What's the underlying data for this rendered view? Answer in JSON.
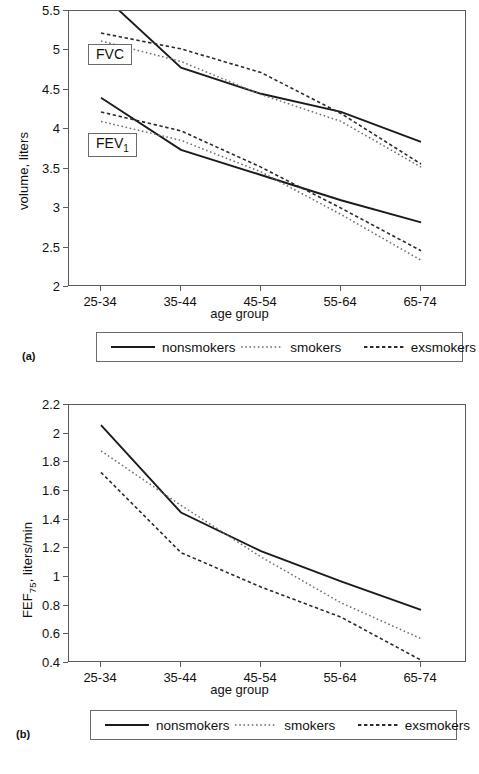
{
  "figure": {
    "panels": [
      {
        "letter": "(a)",
        "xlabel": "age group",
        "ylabel_prefix": "volume, liters",
        "ylabel_sub": "",
        "ylabel_suffix": "",
        "annotations": [
          {
            "name": "fvc",
            "prefix": "FVC",
            "sub": "",
            "suffix": ""
          },
          {
            "name": "fev1",
            "prefix": "FEV",
            "sub": "1",
            "suffix": ""
          }
        ]
      },
      {
        "letter": "(b)",
        "xlabel": "age group",
        "ylabel_prefix": "FEF",
        "ylabel_sub": "75",
        "ylabel_suffix": ", liters/min",
        "annotations": []
      }
    ],
    "legend": {
      "items": [
        {
          "label": "nonsmokers",
          "style": "solid"
        },
        {
          "label": "smokers",
          "style": "dotted"
        },
        {
          "label": "exsmokers",
          "style": "dashed"
        }
      ]
    }
  },
  "chart_data": [
    {
      "id": "panel-a",
      "type": "line",
      "title": "",
      "xlabel": "age group",
      "ylabel": "volume, liters",
      "categories": [
        "25-34",
        "35-44",
        "45-54",
        "55-64",
        "65-74"
      ],
      "ylim": [
        2,
        5.5
      ],
      "yticks": [
        2,
        2.5,
        3,
        3.5,
        4,
        4.5,
        5,
        5.5
      ],
      "ytick_labels": [
        "2",
        "2.5",
        "3",
        "3.5",
        "4",
        "4.5",
        "5",
        "5.5"
      ],
      "grid": false,
      "legend_position": "below",
      "measures": [
        "FVC",
        "FEV1"
      ],
      "series": [
        {
          "name": "nonsmokers",
          "measure": "FVC",
          "style": "solid",
          "values": [
            5.72,
            4.78,
            4.45,
            4.22,
            3.84
          ]
        },
        {
          "name": "smokers",
          "measure": "FVC",
          "style": "dotted",
          "values": [
            5.12,
            4.86,
            4.44,
            4.1,
            3.52
          ]
        },
        {
          "name": "exsmokers",
          "measure": "FVC",
          "style": "dashed",
          "values": [
            5.22,
            5.02,
            4.72,
            4.2,
            3.56
          ]
        },
        {
          "name": "nonsmokers",
          "measure": "FEV1",
          "style": "solid",
          "values": [
            4.4,
            3.74,
            3.42,
            3.1,
            2.82
          ]
        },
        {
          "name": "smokers",
          "measure": "FEV1",
          "style": "dotted",
          "values": [
            4.1,
            3.86,
            3.46,
            2.92,
            2.34
          ]
        },
        {
          "name": "exsmokers",
          "measure": "FEV1",
          "style": "dashed",
          "values": [
            4.22,
            3.98,
            3.52,
            3.0,
            2.46
          ]
        }
      ]
    },
    {
      "id": "panel-b",
      "type": "line",
      "title": "",
      "xlabel": "age group",
      "ylabel": "FEF75, liters/min",
      "categories": [
        "25-34",
        "35-44",
        "45-54",
        "55-64",
        "65-74"
      ],
      "ylim": [
        0.4,
        2.2
      ],
      "yticks": [
        0.4,
        0.6,
        0.8,
        1.0,
        1.2,
        1.4,
        1.6,
        1.8,
        2.0,
        2.2
      ],
      "ytick_labels": [
        "0.4",
        "0.6",
        "0.8",
        "1",
        "1.2",
        "1.4",
        "1.6",
        "1.8",
        "2",
        "2.2"
      ],
      "grid": false,
      "legend_position": "below",
      "series": [
        {
          "name": "nonsmokers",
          "style": "solid",
          "values": [
            2.06,
            1.45,
            1.18,
            0.97,
            0.77
          ]
        },
        {
          "name": "smokers",
          "style": "dotted",
          "values": [
            1.88,
            1.5,
            1.14,
            0.82,
            0.57
          ]
        },
        {
          "name": "exsmokers",
          "style": "dashed",
          "values": [
            1.73,
            1.17,
            0.93,
            0.72,
            0.42
          ]
        }
      ]
    }
  ]
}
